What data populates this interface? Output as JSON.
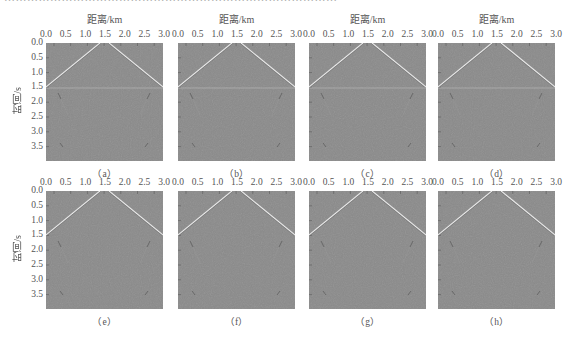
{
  "figure": {
    "top_cropped_text": "……………………………………………………………………………",
    "bottom_cropped_text": "…………………………………………………………………………",
    "x_axis_title": "距离/km",
    "y_axis_title": "时间/s",
    "x_ticks": [
      "0.0",
      "0.5",
      "1.0",
      "1.5",
      "2.0",
      "2.5",
      "3.0"
    ],
    "y_ticks": [
      "0.0",
      "0.5",
      "1.0",
      "1.5",
      "2.0",
      "2.5",
      "3.0",
      "3.5"
    ],
    "panels": [
      {
        "id": "a",
        "caption": "（a）",
        "row": 0,
        "col": 0,
        "horizontal_artifact": true
      },
      {
        "id": "b",
        "caption": "（b）",
        "row": 0,
        "col": 1,
        "horizontal_artifact": true
      },
      {
        "id": "c",
        "caption": "（c）",
        "row": 0,
        "col": 2,
        "horizontal_artifact": true
      },
      {
        "id": "d",
        "caption": "（d）",
        "row": 0,
        "col": 3,
        "horizontal_artifact": true
      },
      {
        "id": "e",
        "caption": "（e）",
        "row": 1,
        "col": 0,
        "horizontal_artifact": false
      },
      {
        "id": "f",
        "caption": "（f）",
        "row": 1,
        "col": 1,
        "horizontal_artifact": false
      },
      {
        "id": "g",
        "caption": "（g）",
        "row": 1,
        "col": 2,
        "horizontal_artifact": false
      },
      {
        "id": "h",
        "caption": "（h）",
        "row": 1,
        "col": 3,
        "horizontal_artifact": false
      }
    ],
    "colors": {
      "background": "#8a8a8a",
      "event": "#e8e8e8",
      "artifact": "#b0b0b0",
      "text": "#555555"
    }
  },
  "chart_data": {
    "type": "heatmap",
    "title": "",
    "xlabel": "距离/km",
    "ylabel": "时间/s",
    "xlim": [
      0.0,
      3.2
    ],
    "ylim": [
      4.0,
      0.0
    ],
    "x_ticks": [
      0.0,
      0.5,
      1.0,
      1.5,
      2.0,
      2.5,
      3.0
    ],
    "y_ticks": [
      0.0,
      0.5,
      1.0,
      1.5,
      2.0,
      2.5,
      3.0,
      3.5
    ],
    "subplots": [
      "(a)",
      "(b)",
      "(c)",
      "(d)",
      "(e)",
      "(f)",
      "(g)",
      "(h)"
    ],
    "events": [
      {
        "name": "direct_wave_left",
        "points": [
          [
            1.6,
            0.0
          ],
          [
            0.0,
            1.5
          ]
        ]
      },
      {
        "name": "direct_wave_right",
        "points": [
          [
            1.75,
            0.0
          ],
          [
            3.2,
            1.5
          ]
        ]
      },
      {
        "name": "artifact_line",
        "t": 1.55,
        "panels": [
          "a",
          "b",
          "c",
          "d"
        ]
      }
    ],
    "grid": false,
    "legend": "none"
  }
}
